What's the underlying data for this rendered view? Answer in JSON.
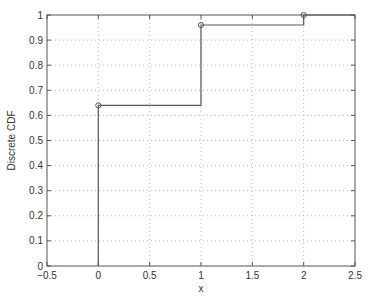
{
  "figure": {
    "background": "#ffffff",
    "axes_color": "#555555",
    "grid_color": "#aaaaaa",
    "line_color": "#555555"
  },
  "chart_data": {
    "type": "line",
    "subtype": "step",
    "title": "",
    "xlabel": "x",
    "ylabel": "Discrete CDF",
    "xlim": [
      -0.5,
      2.5
    ],
    "ylim": [
      0,
      1
    ],
    "xticks": [
      -0.5,
      0,
      0.5,
      1,
      1.5,
      2,
      2.5
    ],
    "xtick_labels": [
      "−0.5",
      "0",
      "0.5",
      "1",
      "1.5",
      "2",
      "2.5"
    ],
    "yticks": [
      0,
      0.1,
      0.2,
      0.3,
      0.4,
      0.5,
      0.6,
      0.7,
      0.8,
      0.9,
      1
    ],
    "ytick_labels": [
      "0",
      "0.1",
      "0.2",
      "0.3",
      "0.4",
      "0.5",
      "0.6",
      "0.7",
      "0.8",
      "0.9",
      "1"
    ],
    "grid": true,
    "legend": null,
    "series": [
      {
        "name": "Discrete CDF",
        "x": [
          0,
          1,
          2
        ],
        "values": [
          0.64,
          0.96,
          1.0
        ],
        "marker": "circle",
        "step_path": [
          [
            0,
            0
          ],
          [
            0,
            0.64
          ],
          [
            1,
            0.64
          ],
          [
            1,
            0.96
          ],
          [
            2,
            0.96
          ],
          [
            2,
            1.0
          ],
          [
            2.5,
            1.0
          ]
        ]
      }
    ]
  }
}
